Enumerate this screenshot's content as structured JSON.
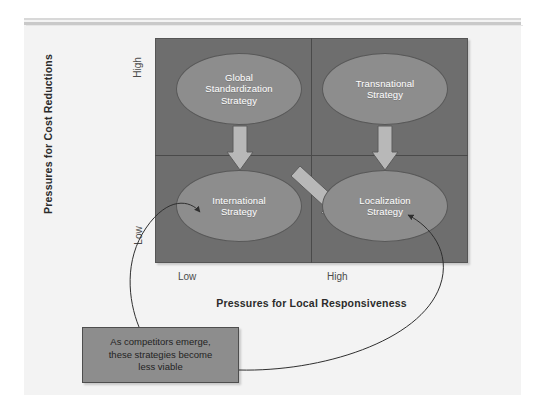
{
  "diagram": {
    "axes": {
      "y": {
        "label": "Pressures for Cost Reductions",
        "high": "High",
        "low": "Low"
      },
      "x": {
        "label": "Pressures for Local Responsiveness",
        "low": "Low",
        "high": "High"
      }
    },
    "quadrants": [
      {
        "id": "global-standardization",
        "label": "Global\nStandardization\nStrategy",
        "line1": "Global",
        "line2": "Standardization",
        "line3": "Strategy",
        "cost": "High",
        "responsiveness": "Low"
      },
      {
        "id": "transnational",
        "label": "Transnational\nStrategy",
        "line1": "Transnational",
        "line2": "Strategy",
        "line3": "",
        "cost": "High",
        "responsiveness": "High"
      },
      {
        "id": "international",
        "label": "International\nStrategy",
        "line1": "International",
        "line2": "Strategy",
        "line3": "",
        "cost": "Low",
        "responsiveness": "Low"
      },
      {
        "id": "localization",
        "label": "Localization\nStrategy",
        "line1": "Localization",
        "line2": "Strategy",
        "line3": "",
        "cost": "Low",
        "responsiveness": "High"
      }
    ],
    "arrows": [
      {
        "id": "international-to-global",
        "from": "International Strategy",
        "to": "Global Standardization Strategy",
        "direction": "up"
      },
      {
        "id": "international-to-transnational",
        "from": "International Strategy",
        "to": "Transnational Strategy",
        "direction": "diagonal-up-right"
      },
      {
        "id": "localization-to-transnational",
        "from": "Localization Strategy",
        "to": "Transnational Strategy",
        "direction": "up"
      }
    ],
    "callout": {
      "text": "As competitors emerge, these strategies become less viable",
      "line1": "As competitors emerge,",
      "line2": "these strategies become",
      "line3": "less viable",
      "points_to": [
        "International Strategy",
        "Localization Strategy"
      ]
    },
    "colors": {
      "matrix_fill": "#6e6e6e",
      "ellipse_fill": "#8d8d8d",
      "callout_fill": "#8d8d8d",
      "arrow_fill": "#b4b4b4",
      "panel_bg": "#f3f3f3",
      "label_text": "#2b2b2b",
      "ellipse_text": "#ffffff"
    }
  }
}
